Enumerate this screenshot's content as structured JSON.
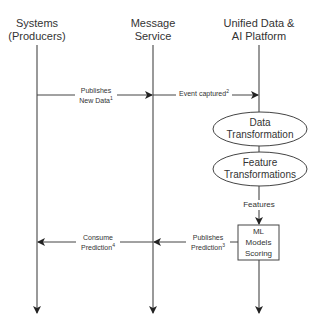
{
  "diagram": {
    "type": "sequence",
    "lanes": [
      {
        "id": "producers",
        "title_line1": "Systems",
        "title_line2": "(Producers)"
      },
      {
        "id": "message",
        "title_line1": "Message",
        "title_line2": "Service"
      },
      {
        "id": "platform",
        "title_line1": "Unified Data &",
        "title_line2": "AI Platform"
      }
    ],
    "messages": [
      {
        "from": "producers",
        "to": "message",
        "line1": "Publishes",
        "line2": "New Data",
        "footnote": "1"
      },
      {
        "from": "message",
        "to": "platform",
        "line1": "Event captured",
        "footnote": "2"
      },
      {
        "from": "platform",
        "to": "message",
        "line1": "Publishes",
        "line2": "Prediction",
        "footnote": "3"
      },
      {
        "from": "message",
        "to": "producers",
        "line1": "Consume",
        "line2": "Prediction",
        "footnote": "4"
      }
    ],
    "nodes": [
      {
        "id": "data-transformation",
        "shape": "ellipse",
        "line1": "Data",
        "line2": "Transformation"
      },
      {
        "id": "feature-transformations",
        "shape": "ellipse",
        "line1": "Feature",
        "line2": "Transformations"
      },
      {
        "id": "ml-scoring",
        "shape": "rectangle",
        "line1": "ML",
        "line2": "Models",
        "line3": "Scoring"
      }
    ],
    "edge_labels": {
      "features": "Features"
    },
    "colors": {
      "line": "#333333",
      "text": "#333333",
      "background": "#ffffff"
    }
  }
}
